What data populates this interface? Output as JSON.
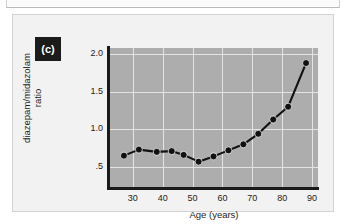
{
  "figure": {
    "panel_letter": "(c)"
  },
  "chart_data": {
    "type": "line",
    "title": "",
    "subtitle": "",
    "xlabel": "Age (years)",
    "ylabel": "diazepam/midazolam",
    "ylabel_line2": "ratio",
    "xlim": [
      22,
      92
    ],
    "ylim": [
      0.22,
      2.08
    ],
    "xticks": [
      30,
      40,
      50,
      60,
      70,
      80,
      90
    ],
    "xtick_labels": [
      "30",
      "40",
      "50",
      "60",
      "70",
      "80",
      "90"
    ],
    "yticks": [
      0.5,
      1.0,
      1.5,
      2.0
    ],
    "ytick_labels": [
      ".5",
      "1.0",
      "1.5",
      "2.0"
    ],
    "grid": true,
    "grid_color": "#e4e4e4",
    "plot_background": "#adadad",
    "legend": null,
    "series": [
      {
        "name": "diazepam/midazolam ratio",
        "marker": "filled-circle",
        "marker_color": "#111111",
        "line_color": "#111111",
        "x": [
          27,
          32,
          38,
          43,
          47,
          52,
          57,
          62,
          67,
          72,
          77,
          82,
          88
        ],
        "values": [
          0.65,
          0.73,
          0.7,
          0.71,
          0.66,
          0.57,
          0.64,
          0.72,
          0.8,
          0.94,
          1.13,
          1.3,
          1.88
        ]
      }
    ]
  },
  "colors": {
    "page_background": "#ffffff",
    "panel_background": "#f2f2f2",
    "panel_border": "#d2d2d2",
    "axis": "#1a1a1a",
    "badge_background": "#1b1b1b",
    "badge_text": "#ffffff",
    "text": "#1c1c1c"
  }
}
